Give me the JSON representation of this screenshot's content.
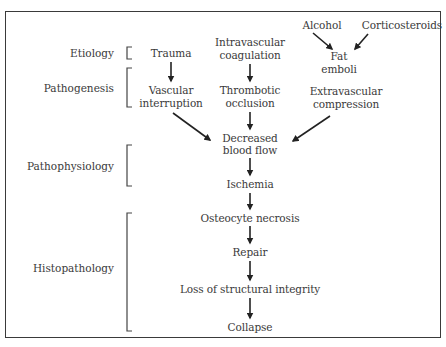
{
  "diagram": {
    "stage_labels": [
      {
        "id": "etiology",
        "text": "Etiology"
      },
      {
        "id": "pathogenesis",
        "text": "Pathogenesis"
      },
      {
        "id": "pathophysiology",
        "text": "Pathophysiology"
      },
      {
        "id": "histopathology",
        "text": "Histopathology"
      }
    ],
    "nodes": {
      "alcohol": "Alcohol",
      "corticosteroids": "Corticosteroids",
      "trauma": "Trauma",
      "intravascular_1": "Intravascular",
      "intravascular_2": "coagulation",
      "fat_1": "Fat",
      "fat_2": "emboli",
      "vascular_1": "Vascular",
      "vascular_2": "interruption",
      "thrombotic_1": "Thrombotic",
      "thrombotic_2": "occlusion",
      "extravascular_1": "Extravascular",
      "extravascular_2": "compression",
      "decreased_1": "Decreased",
      "decreased_2": "blood flow",
      "ischemia": "Ischemia",
      "osteocyte": "Osteocyte necrosis",
      "repair": "Repair",
      "loss": "Loss of structural integrity",
      "collapse": "Collapse"
    },
    "edges": [
      [
        "Alcohol",
        "Fat emboli"
      ],
      [
        "Corticosteroids",
        "Fat emboli"
      ],
      [
        "Trauma",
        "Vascular interruption"
      ],
      [
        "Intravascular coagulation",
        "Thrombotic occlusion"
      ],
      [
        "Vascular interruption",
        "Decreased blood flow"
      ],
      [
        "Thrombotic occlusion",
        "Decreased blood flow"
      ],
      [
        "Extravascular compression",
        "Decreased blood flow"
      ],
      [
        "Decreased blood flow",
        "Ischemia"
      ],
      [
        "Ischemia",
        "Osteocyte necrosis"
      ],
      [
        "Osteocyte necrosis",
        "Repair"
      ],
      [
        "Repair",
        "Loss of structural integrity"
      ],
      [
        "Loss of structural integrity",
        "Collapse"
      ]
    ],
    "colors": {
      "ink": "#333333",
      "frame": "#3a3a3a",
      "background": "#ffffff"
    }
  }
}
